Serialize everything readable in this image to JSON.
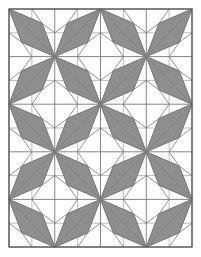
{
  "figure": {
    "grid": {
      "cols": 4,
      "rows": 5,
      "x0": 9,
      "y0": 9,
      "x1": 192,
      "y1": 247
    },
    "orientation_rule": "checkerboard: (row+col) even = TL-BR diagonal, odd = BL-TR diagonal",
    "colors": {
      "background": "#ffffff",
      "rhombus_fill": "#8e8e8e",
      "line": "#777777",
      "frame": "#555555"
    }
  }
}
